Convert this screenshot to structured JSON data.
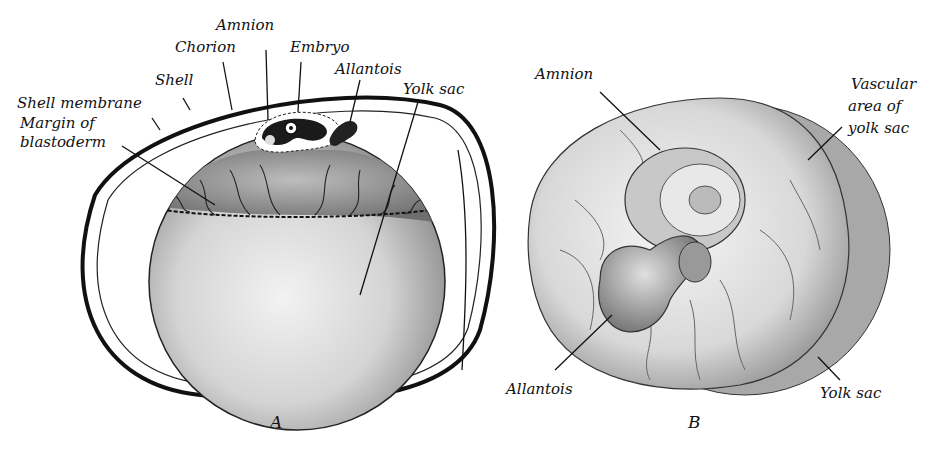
{
  "figure_a": {
    "caption": "A",
    "labels": {
      "amnion": "Amnion",
      "chorion": "Chorion",
      "embryo": "Embryo",
      "allantois": "Allantois",
      "shell": "Shell",
      "yolk_sac": "Yolk sac",
      "shell_membrane": "Shell membrane",
      "margin_line1": "Margin of",
      "margin_line2": "blastoderm"
    }
  },
  "figure_b": {
    "caption": "B",
    "labels": {
      "amnion": "Amnion",
      "vascular_line1": "Vascular",
      "vascular_line2": "area of",
      "vascular_line3": "yolk sac",
      "allantois": "Allantois",
      "yolk_sac": "Yolk sac"
    }
  },
  "colors": {
    "ink": "#111111",
    "paper": "#ffffff",
    "yolk_light": "#e6e6e6",
    "yolk_shade": "#9a9a9a",
    "vascular_dark": "#555555"
  }
}
